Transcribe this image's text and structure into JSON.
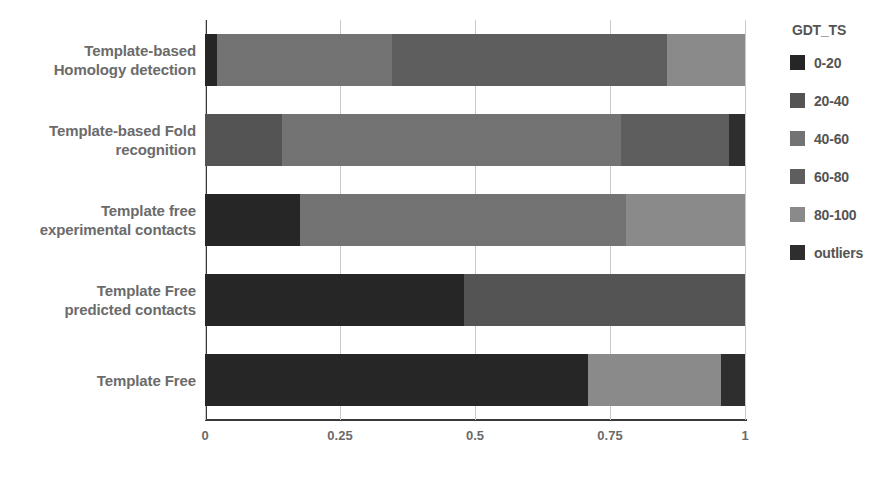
{
  "chart_data": {
    "type": "bar",
    "orientation": "horizontal",
    "stacked": true,
    "normalized": true,
    "title": "",
    "xlabel": "",
    "ylabel": "",
    "xlim": [
      0,
      1
    ],
    "xticks": [
      0,
      0.25,
      0.5,
      0.75,
      1
    ],
    "xticklabels": [
      "0",
      "0.25",
      "0.5",
      "0.75",
      "1"
    ],
    "grid": true,
    "legend": {
      "title": "GDT_TS",
      "position": "right",
      "entries": [
        "0-20",
        "20-40",
        "40-60",
        "60-80",
        "80-100",
        "outliers"
      ]
    },
    "colors": {
      "0-20": "#262626",
      "20-40": "#545454",
      "40-60": "#737373",
      "60-80": "#5e5e5e",
      "80-100": "#8a8a8a",
      "outliers": "#2e2e2e"
    },
    "categories": [
      "Template-based Homology detection",
      "Template-based Fold recognition",
      "Template free experimental contacts",
      "Template Free predicted contacts",
      "Template Free"
    ],
    "category_lines": [
      [
        "Template-based",
        "Homology detection"
      ],
      [
        "Template-based Fold",
        "recognition"
      ],
      [
        "Template free",
        "experimental contacts"
      ],
      [
        "Template Free",
        "predicted contacts"
      ],
      [
        "Template Free"
      ]
    ],
    "series": [
      {
        "name": "0-20",
        "values": [
          0.022,
          0.0,
          0.175,
          0.48,
          0.71
        ]
      },
      {
        "name": "20-40",
        "values": [
          0.0,
          0.143,
          0.0,
          0.52,
          0.0
        ]
      },
      {
        "name": "40-60",
        "values": [
          0.324,
          0.627,
          0.605,
          0.0,
          0.0
        ]
      },
      {
        "name": "60-80",
        "values": [
          0.509,
          0.2,
          0.0,
          0.0,
          0.0
        ]
      },
      {
        "name": "80-100",
        "values": [
          0.145,
          0.0,
          0.22,
          0.0,
          0.245
        ]
      },
      {
        "name": "outliers",
        "values": [
          0.0,
          0.03,
          0.0,
          0.0,
          0.045
        ]
      }
    ],
    "bars": [
      {
        "category": "Template-based Homology detection",
        "segments": [
          {
            "key": "0-20",
            "value": 0.022
          },
          {
            "key": "40-60",
            "value": 0.324
          },
          {
            "key": "60-80",
            "value": 0.509
          },
          {
            "key": "80-100",
            "value": 0.145
          }
        ]
      },
      {
        "category": "Template-based Fold recognition",
        "segments": [
          {
            "key": "20-40",
            "value": 0.143
          },
          {
            "key": "40-60",
            "value": 0.627
          },
          {
            "key": "60-80",
            "value": 0.2
          },
          {
            "key": "outliers",
            "value": 0.03
          }
        ]
      },
      {
        "category": "Template free experimental contacts",
        "segments": [
          {
            "key": "0-20",
            "value": 0.175
          },
          {
            "key": "40-60",
            "value": 0.605
          },
          {
            "key": "80-100",
            "value": 0.22
          }
        ]
      },
      {
        "category": "Template Free predicted contacts",
        "segments": [
          {
            "key": "0-20",
            "value": 0.48
          },
          {
            "key": "20-40",
            "value": 0.52
          }
        ]
      },
      {
        "category": "Template Free",
        "segments": [
          {
            "key": "0-20",
            "value": 0.71
          },
          {
            "key": "80-100",
            "value": 0.245
          },
          {
            "key": "outliers",
            "value": 0.045
          }
        ]
      }
    ]
  }
}
